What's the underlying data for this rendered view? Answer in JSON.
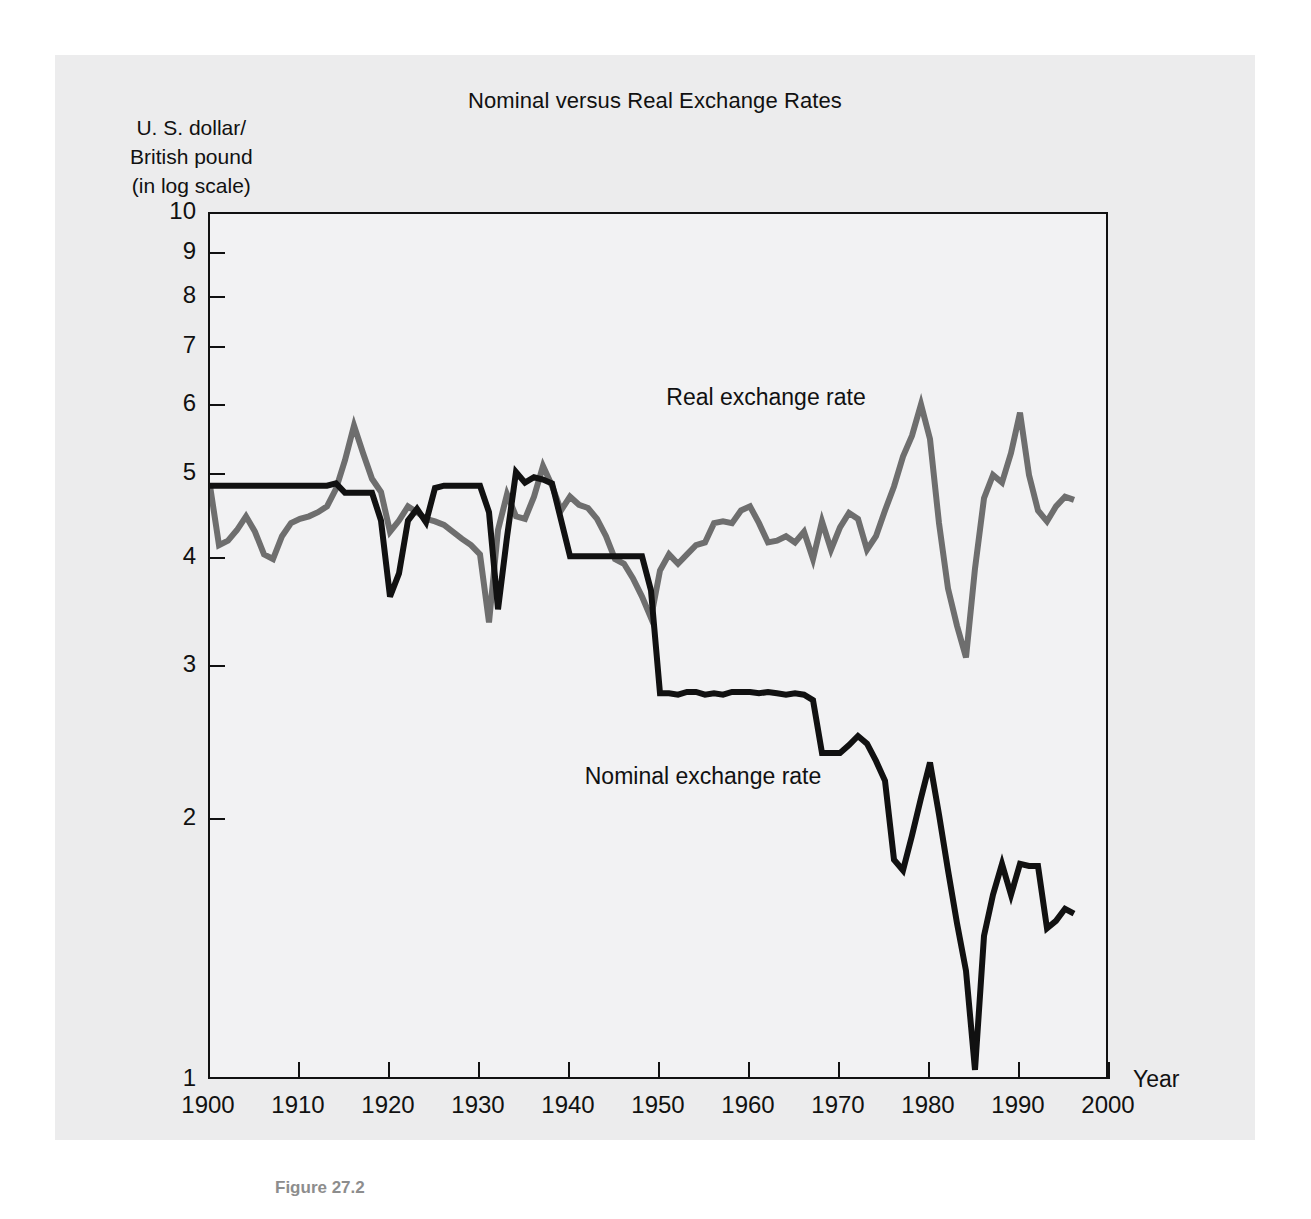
{
  "figure": {
    "caption": "Figure 27.2"
  },
  "chart": {
    "title": "Nominal versus Real Exchange Rates",
    "y_axis_title": "U. S. dollar/\nBritish pound\n(in log scale)",
    "x_axis_title": "Year",
    "colors": {
      "nominal": "#111111",
      "real": "#6e6e6e",
      "panel_background": "#ececed",
      "plot_background": "#f2f2f3",
      "axis": "#111111",
      "caption": "#8d8d8d"
    },
    "labels": {
      "real": "Real exchange rate",
      "nominal": "Nominal exchange rate"
    }
  },
  "chart_data": {
    "type": "line",
    "title": "Nominal versus Real Exchange Rates",
    "xlabel": "Year",
    "ylabel": "U. S. dollar/British pound (in log scale)",
    "yscale": "log",
    "ylim": [
      1,
      10
    ],
    "xlim": [
      1900,
      2000
    ],
    "ytick_labels": [
      "1",
      "2",
      "3",
      "4",
      "5",
      "6",
      "7",
      "8",
      "9",
      "10"
    ],
    "yticks": [
      1,
      2,
      3,
      4,
      5,
      6,
      7,
      8,
      9,
      10
    ],
    "xticks": [
      1900,
      1910,
      1920,
      1930,
      1940,
      1950,
      1960,
      1970,
      1980,
      1990,
      2000
    ],
    "xtick_labels": [
      "1900",
      "1910",
      "1920",
      "1930",
      "1940",
      "1950",
      "1960",
      "1970",
      "1980",
      "1990",
      "2000"
    ],
    "grid": false,
    "legend": "inline-annotations",
    "annotations": [
      {
        "text": "Real exchange rate",
        "x": 1962,
        "y": 6.1
      },
      {
        "text": "Nominal exchange rate",
        "x": 1955,
        "y": 2.23
      }
    ],
    "series": [
      {
        "name": "Nominal exchange rate",
        "color": "#111111",
        "x": [
          1900,
          1901,
          1902,
          1903,
          1904,
          1905,
          1906,
          1907,
          1908,
          1909,
          1910,
          1911,
          1912,
          1913,
          1914,
          1915,
          1916,
          1917,
          1918,
          1919,
          1920,
          1921,
          1922,
          1923,
          1924,
          1925,
          1926,
          1927,
          1928,
          1929,
          1930,
          1931,
          1932,
          1933,
          1934,
          1935,
          1936,
          1937,
          1938,
          1939,
          1940,
          1941,
          1942,
          1943,
          1944,
          1945,
          1946,
          1947,
          1948,
          1949,
          1950,
          1951,
          1952,
          1953,
          1954,
          1955,
          1956,
          1957,
          1958,
          1959,
          1960,
          1961,
          1962,
          1963,
          1964,
          1965,
          1966,
          1967,
          1968,
          1969,
          1970,
          1971,
          1972,
          1973,
          1974,
          1975,
          1976,
          1977,
          1978,
          1979,
          1980,
          1981,
          1982,
          1983,
          1984,
          1985,
          1986,
          1987,
          1988,
          1989,
          1990,
          1991,
          1992,
          1993,
          1994,
          1995,
          1996
        ],
        "y": [
          4.86,
          4.86,
          4.86,
          4.86,
          4.86,
          4.86,
          4.86,
          4.86,
          4.86,
          4.86,
          4.86,
          4.86,
          4.86,
          4.86,
          4.89,
          4.77,
          4.77,
          4.77,
          4.77,
          4.43,
          3.62,
          3.85,
          4.43,
          4.57,
          4.41,
          4.83,
          4.86,
          4.86,
          4.86,
          4.86,
          4.86,
          4.53,
          3.5,
          4.24,
          5.04,
          4.9,
          4.97,
          4.94,
          4.89,
          4.44,
          4.03,
          4.03,
          4.03,
          4.03,
          4.03,
          4.03,
          4.03,
          4.03,
          4.03,
          3.68,
          2.8,
          2.8,
          2.79,
          2.81,
          2.81,
          2.79,
          2.8,
          2.79,
          2.81,
          2.81,
          2.81,
          2.8,
          2.81,
          2.8,
          2.79,
          2.8,
          2.79,
          2.75,
          2.39,
          2.39,
          2.39,
          2.44,
          2.5,
          2.45,
          2.34,
          2.22,
          1.8,
          1.75,
          1.92,
          2.12,
          2.33,
          2.03,
          1.75,
          1.52,
          1.34,
          1.03,
          1.47,
          1.64,
          1.78,
          1.64,
          1.78,
          1.77,
          1.77,
          1.5,
          1.53,
          1.58,
          1.56
        ]
      },
      {
        "name": "Real exchange rate",
        "color": "#6e6e6e",
        "x": [
          1900,
          1901,
          1902,
          1903,
          1904,
          1905,
          1906,
          1907,
          1908,
          1909,
          1910,
          1911,
          1912,
          1913,
          1914,
          1915,
          1916,
          1917,
          1918,
          1919,
          1920,
          1921,
          1922,
          1923,
          1924,
          1925,
          1926,
          1927,
          1928,
          1929,
          1930,
          1931,
          1932,
          1933,
          1934,
          1935,
          1936,
          1937,
          1938,
          1939,
          1940,
          1941,
          1942,
          1943,
          1944,
          1945,
          1946,
          1947,
          1948,
          1949,
          1950,
          1951,
          1952,
          1953,
          1954,
          1955,
          1956,
          1957,
          1958,
          1959,
          1960,
          1961,
          1962,
          1963,
          1964,
          1965,
          1966,
          1967,
          1968,
          1969,
          1970,
          1971,
          1972,
          1973,
          1974,
          1975,
          1976,
          1977,
          1978,
          1979,
          1980,
          1981,
          1982,
          1983,
          1984,
          1985,
          1986,
          1987,
          1988,
          1989,
          1990,
          1991,
          1992,
          1993,
          1994,
          1995,
          1996
        ],
        "y": [
          4.86,
          4.15,
          4.2,
          4.32,
          4.48,
          4.3,
          4.05,
          4.0,
          4.25,
          4.4,
          4.45,
          4.48,
          4.53,
          4.6,
          4.82,
          5.2,
          5.7,
          5.3,
          4.95,
          4.78,
          4.3,
          4.43,
          4.6,
          4.53,
          4.45,
          4.42,
          4.38,
          4.3,
          4.22,
          4.15,
          4.05,
          3.38,
          4.32,
          4.75,
          4.48,
          4.45,
          4.72,
          5.12,
          4.86,
          4.55,
          4.72,
          4.62,
          4.58,
          4.45,
          4.25,
          4.0,
          3.95,
          3.8,
          3.62,
          3.42,
          3.88,
          4.05,
          3.95,
          4.05,
          4.15,
          4.18,
          4.4,
          4.42,
          4.4,
          4.55,
          4.6,
          4.4,
          4.18,
          4.2,
          4.25,
          4.18,
          4.3,
          4.0,
          4.42,
          4.1,
          4.35,
          4.52,
          4.45,
          4.1,
          4.25,
          4.55,
          4.85,
          5.25,
          5.55,
          6.03,
          5.5,
          4.4,
          3.7,
          3.35,
          3.08,
          3.9,
          4.7,
          5.0,
          4.9,
          5.3,
          5.9,
          5.0,
          4.55,
          4.42,
          4.6,
          4.72,
          4.68
        ]
      }
    ]
  }
}
